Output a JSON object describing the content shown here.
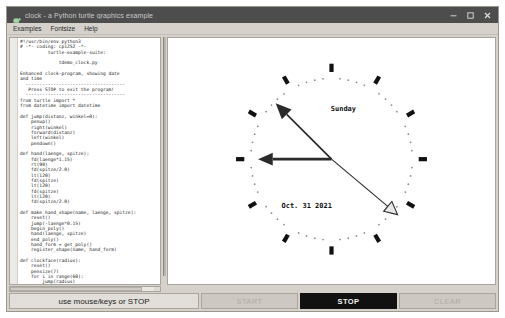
{
  "window": {
    "title": "clock - a Python turtle graphics example",
    "icon": "turtle-icon",
    "controls": [
      {
        "name": "minimize-button",
        "glyph": "minimize-icon"
      },
      {
        "name": "maximize-button",
        "glyph": "maximize-icon"
      },
      {
        "name": "close-button",
        "glyph": "close-icon"
      }
    ]
  },
  "menubar": {
    "items": [
      {
        "label": "Examples",
        "name": "menu-examples"
      },
      {
        "label": "Fontsize",
        "name": "menu-fontsize"
      },
      {
        "label": "Help",
        "name": "menu-help"
      }
    ]
  },
  "code_pane": {
    "source": "#!/usr/bin/env python3\n# -*- coding: cp1252 -*-\n          turtle-example-suite:\n\n              tdemo_clock.py\n\nEnhanced clock-program, showing date\nand time\n  ------------------------------------\n   Press STOP to exit the program!\n  ------------------------------------\nfrom turtle import *\nfrom datetime import datetime\n\ndef jump(distanz, winkel=0):\n    penup()\n    right(winkel)\n    forward(distanz)\n    left(winkel)\n    pendown()\n\ndef hand(laenge, spitze):\n    fd(laenge*1.15)\n    rt(90)\n    fd(spitze/2.0)\n    lt(120)\n    fd(spitze)\n    lt(120)\n    fd(spitze)\n    lt(120)\n    fd(spitze/2.0)\n\ndef make_hand_shape(name, laenge, spitze):\n    reset()\n    jump(-laenge*0.15)\n    begin_poly()\n    hand(laenge, spitze)\n    end_poly()\n    hand_form = get_poly()\n    register_shape(name, hand_form)\n\ndef clockface(radius):\n    reset()\n    pensize(7)\n    for i in range(60):\n        jump(radius)"
  },
  "canvas": {
    "name": "turtle-canvas",
    "clock": {
      "center_x": 338,
      "center_y": 158,
      "hour_tick_count": 12,
      "minute_dot_count": 60,
      "weekday_label": "Sunday",
      "date_label": "Oct. 31 2021",
      "hour_hand_angle_deg": 315,
      "minute_hand_angle_deg": 270,
      "second_hand_angle_deg": 130,
      "tick_color": "#111111",
      "dot_color": "#8a8a8a",
      "hand_color": "#2b2b2b",
      "second_hand_fill": "#e8e8e8"
    }
  },
  "buttonbar": {
    "status_label": "use mouse/keys or STOP",
    "buttons": [
      {
        "label": "START",
        "name": "start-button",
        "state": "disabled"
      },
      {
        "label": "STOP",
        "name": "stop-button",
        "state": "active"
      },
      {
        "label": "CLEAR",
        "name": "clear-button",
        "state": "disabled"
      }
    ]
  }
}
